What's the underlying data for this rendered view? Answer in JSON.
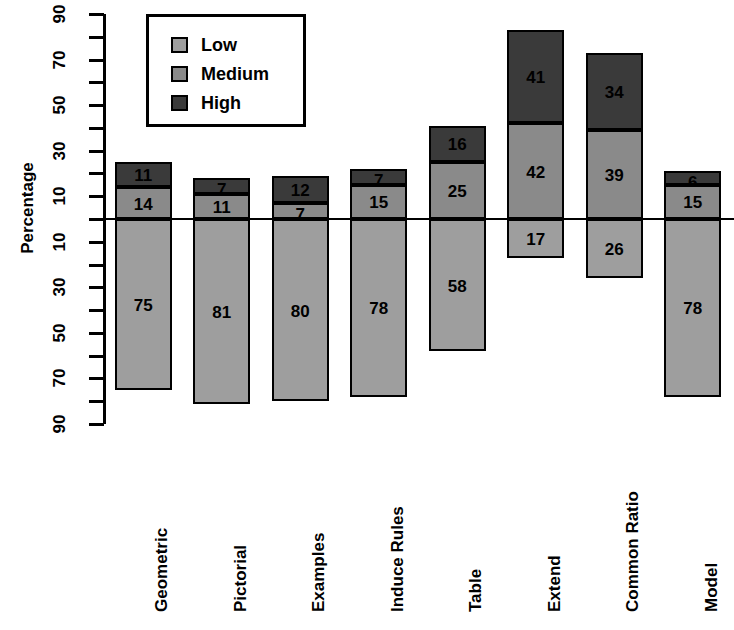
{
  "chart_data": {
    "type": "bar",
    "subtype": "diverging-stacked-bar",
    "title": "",
    "xlabel": "",
    "ylabel": "Percentage",
    "ylim": [
      -90,
      90
    ],
    "y_tick_labels": [
      "90",
      "70",
      "50",
      "30",
      "10",
      "10",
      "30",
      "50",
      "70",
      "90"
    ],
    "y_tick_values": [
      90,
      70,
      50,
      30,
      10,
      -10,
      -30,
      -50,
      -70,
      -90
    ],
    "y_minor_tick_values": [
      80,
      60,
      40,
      20,
      0,
      -20,
      -40,
      -60,
      -80
    ],
    "grid": false,
    "legend_position": "top-left",
    "categories": [
      "Geometric",
      "Pictorial",
      "Examples",
      "Induce Rules",
      "Table",
      "Extend",
      "Common Ratio",
      "Model"
    ],
    "series": [
      {
        "name": "Low",
        "color": "#9e9e9e",
        "direction": "down",
        "values": [
          75,
          81,
          80,
          78,
          58,
          17,
          26,
          78
        ]
      },
      {
        "name": "Medium",
        "color": "#8a8a8a",
        "direction": "up",
        "values": [
          14,
          11,
          7,
          15,
          25,
          42,
          39,
          15
        ]
      },
      {
        "name": "High",
        "color": "#3a3a3a",
        "direction": "up",
        "values": [
          11,
          7,
          12,
          7,
          16,
          41,
          34,
          6
        ]
      }
    ]
  },
  "legend": {
    "items": [
      {
        "label": "Low",
        "color": "#9e9e9e"
      },
      {
        "label": "Medium",
        "color": "#8a8a8a"
      },
      {
        "label": "High",
        "color": "#3a3a3a"
      }
    ]
  },
  "axis": {
    "y_title": "Percentage"
  }
}
